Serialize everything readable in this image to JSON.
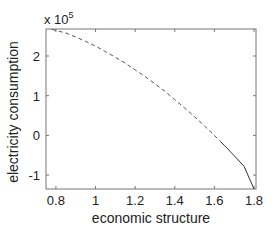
{
  "chart_data": {
    "type": "line",
    "title": "",
    "xlabel": "economic structure",
    "ylabel": "electricity consumption",
    "y_multiplier_label": "x 10",
    "y_multiplier_exponent": "5",
    "xlim": [
      0.75,
      1.81
    ],
    "ylim": [
      -135000,
      268000
    ],
    "xticks": [
      0.8,
      1,
      1.2,
      1.4,
      1.6,
      1.8
    ],
    "xtick_labels": [
      "0.8",
      "1",
      "1.2",
      "1.4",
      "1.6",
      "1.8"
    ],
    "yticks": [
      -100000,
      0,
      100000,
      200000
    ],
    "ytick_labels": [
      "-1",
      "0",
      "1",
      "2"
    ],
    "grid": false,
    "legend": null,
    "series": [
      {
        "name": "dashed segment",
        "style": "dashed",
        "color": "#555555",
        "x": [
          0.78,
          0.85,
          0.9,
          0.95,
          1.0,
          1.05,
          1.1,
          1.15,
          1.2,
          1.25,
          1.3,
          1.35,
          1.4,
          1.45,
          1.5,
          1.55,
          1.6,
          1.63
        ],
        "y": [
          267000,
          258000,
          248000,
          237000,
          225000,
          211000,
          197000,
          182000,
          165000,
          148000,
          130000,
          111000,
          90000,
          69000,
          47000,
          24000,
          0,
          -15000
        ]
      },
      {
        "name": "solid segment",
        "style": "solid",
        "color": "#333333",
        "x": [
          1.63,
          1.65,
          1.7,
          1.75,
          1.8
        ],
        "y": [
          -15000,
          -25000,
          -51000,
          -78000,
          -135000
        ]
      }
    ]
  }
}
